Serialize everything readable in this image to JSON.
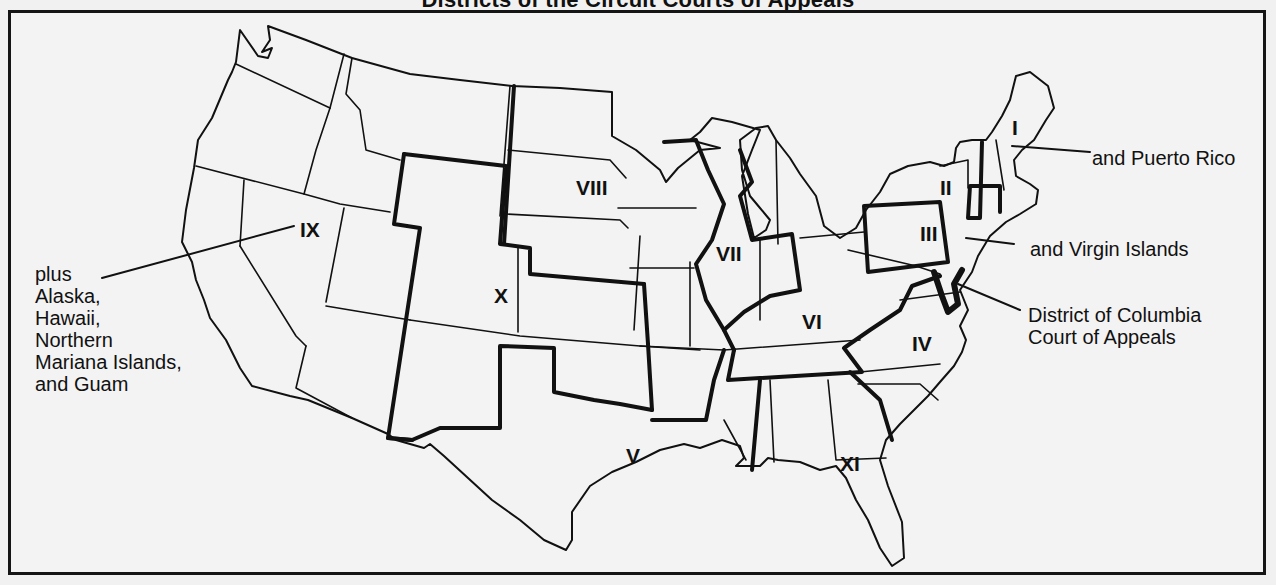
{
  "title": "Districts of the Circuit Courts of Appeals",
  "circuits": [
    {
      "id": "I",
      "label": "I"
    },
    {
      "id": "II",
      "label": "II"
    },
    {
      "id": "III",
      "label": "III"
    },
    {
      "id": "IV",
      "label": "IV"
    },
    {
      "id": "V",
      "label": "V"
    },
    {
      "id": "VI",
      "label": "VI"
    },
    {
      "id": "VII",
      "label": "VII"
    },
    {
      "id": "VIII",
      "label": "VIII"
    },
    {
      "id": "IX",
      "label": "IX"
    },
    {
      "id": "X",
      "label": "X"
    },
    {
      "id": "XI",
      "label": "XI"
    }
  ],
  "notes": {
    "ninth": [
      "plus",
      "Alaska,",
      "Hawaii,",
      "Northern",
      "Mariana Islands,",
      "and Guam"
    ],
    "first": "and Puerto Rico",
    "third": "and Virgin Islands",
    "dc": [
      "District of Columbia",
      "Court of Appeals"
    ]
  },
  "colors": {
    "ink": "#111111",
    "paper": "#f2f2f2"
  }
}
